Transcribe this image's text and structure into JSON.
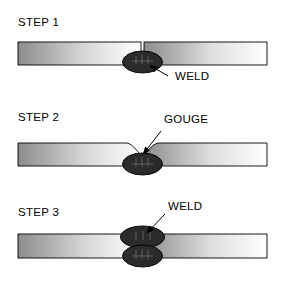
{
  "figure": {
    "type": "welding-repair-sequence-diagram",
    "background_color": "#ffffff",
    "line_color": "#000000",
    "weld_fill_color": "#2b2b2b",
    "plate_gradient_dark": "#8a8a8a",
    "plate_gradient_light": "#ffffff"
  },
  "steps": [
    {
      "id": "step-1",
      "label": "STEP 1",
      "callout": {
        "label": "WELD",
        "target": "weld-bead"
      },
      "features": [
        "butt-joint-seam",
        "weld-bead-below-seam"
      ]
    },
    {
      "id": "step-2",
      "label": "STEP 2",
      "callout": {
        "label": "GOUGE",
        "target": "gouge-cavity"
      },
      "features": [
        "gouged-cavity-top-surface",
        "remaining-weld-bead-below"
      ]
    },
    {
      "id": "step-3",
      "label": "STEP 3",
      "callout": {
        "label": "WELD",
        "target": "weld-bead-top"
      },
      "features": [
        "weld-bead-top",
        "weld-bead-bottom"
      ]
    }
  ]
}
